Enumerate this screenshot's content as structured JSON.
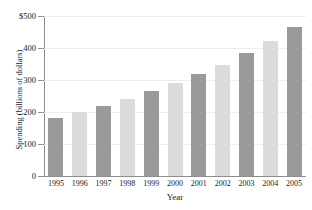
{
  "figure": {
    "title_remnant": "",
    "background_color": "#ffffff"
  },
  "chart_data": {
    "type": "bar",
    "title": "",
    "xlabel": "Year",
    "ylabel": "Spending (billions of dollars)",
    "categories": [
      "1995",
      "1996",
      "1997",
      "1998",
      "1999",
      "2000",
      "2001",
      "2002",
      "2003",
      "2004",
      "2005"
    ],
    "values": [
      180,
      200,
      220,
      240,
      265,
      292,
      320,
      348,
      385,
      422,
      465
    ],
    "ylim": [
      0,
      500
    ],
    "ytick_values": [
      0,
      100,
      200,
      300,
      400,
      500
    ],
    "ytick_labels": [
      "0",
      "100",
      "200",
      "300",
      "400",
      "$500"
    ],
    "xtick_labels": [
      "1995",
      "1996",
      "1997",
      "1998",
      "1999",
      "2000",
      "2001",
      "2002",
      "2003",
      "2004",
      "2005"
    ],
    "grid": "horizontal",
    "legend": "none",
    "bar_colors": [
      "#9a9a9a",
      "#dcdcdc",
      "#9a9a9a",
      "#dcdcdc",
      "#9a9a9a",
      "#dcdcdc",
      "#9a9a9a",
      "#dcdcdc",
      "#9a9a9a",
      "#dcdcdc",
      "#9a9a9a"
    ],
    "color_dark": "#9a9a9a",
    "color_light": "#dcdcdc",
    "axis_color": "#8e8e8e",
    "gridline_color": "#ededed"
  }
}
